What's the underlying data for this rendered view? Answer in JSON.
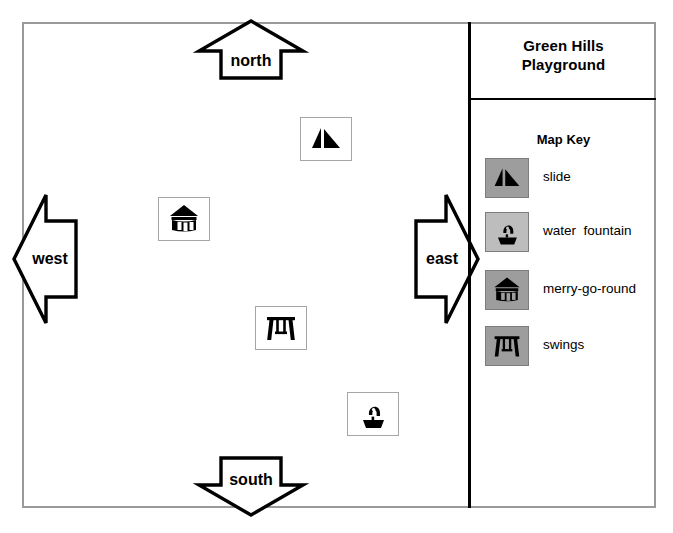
{
  "map": {
    "title": "Green Hills\nPlayground",
    "title_line1": "Green Hills",
    "title_line2": "Playground",
    "key_heading": "Map Key",
    "compass": [
      {
        "name": "north",
        "label": "north",
        "direction": "up"
      },
      {
        "name": "south",
        "label": "south",
        "direction": "down"
      },
      {
        "name": "west",
        "label": "west",
        "direction": "left"
      },
      {
        "name": "east",
        "label": "east",
        "direction": "right"
      }
    ],
    "legend": [
      {
        "label": "slide",
        "icon": "slide-icon",
        "swatch_color": "#9d9d9d"
      },
      {
        "label": "water  fountain",
        "icon": "water-fountain-icon",
        "swatch_color": "#bdbdbd"
      },
      {
        "label": "merry-go-round",
        "icon": "merry-go-round-icon",
        "swatch_color": "#9d9d9d"
      },
      {
        "label": "swings",
        "icon": "swings-icon",
        "swatch_color": "#9d9d9d"
      }
    ],
    "features": [
      {
        "name": "slide",
        "icon": "slide-icon",
        "x": 300,
        "y": 117,
        "w": 52,
        "h": 44
      },
      {
        "name": "merry-go-round",
        "icon": "merry-go-round-icon",
        "x": 158,
        "y": 197,
        "w": 52,
        "h": 44
      },
      {
        "name": "swings",
        "icon": "swings-icon",
        "x": 255,
        "y": 306,
        "w": 52,
        "h": 44
      },
      {
        "name": "water fountain",
        "icon": "water-fountain-icon",
        "x": 347,
        "y": 392,
        "w": 52,
        "h": 44
      }
    ],
    "colors": {
      "frame": "#9a9a9a",
      "divider": "#000000",
      "swatch_dark": "#9d9d9d",
      "swatch_light": "#bdbdbd",
      "glyph": "#000000",
      "background": "#ffffff"
    }
  }
}
